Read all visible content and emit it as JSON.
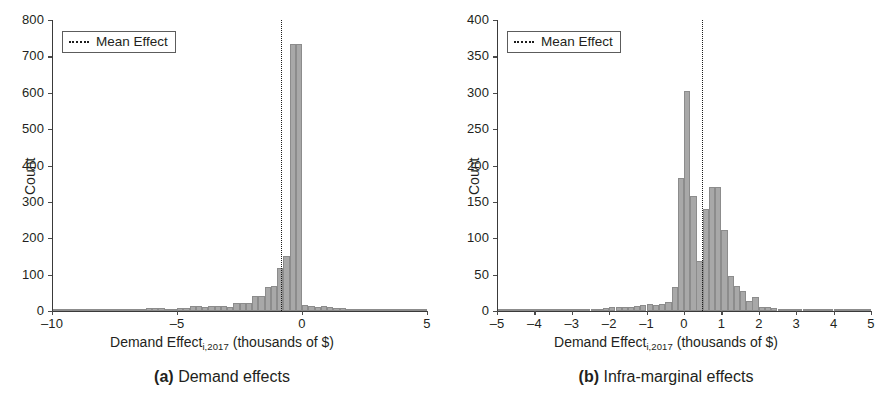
{
  "figure": {
    "panels": [
      {
        "id": "a",
        "caption_tag": "(a)",
        "caption_text": "Demand effects",
        "legend": {
          "label": "Mean Effect",
          "style": "dotted",
          "color": "#1d1d1d"
        },
        "chart_data": {
          "type": "bar",
          "subtype": "histogram",
          "title": "",
          "xlabel": "Demand Effect_{i,2017} (thousands of $)",
          "xlabel_main": "Demand Effect",
          "xlabel_sub": "i,2017",
          "xlabel_tail": " (thousands of $)",
          "ylabel": "Count",
          "xlim": [
            -10,
            5
          ],
          "ylim": [
            0,
            800
          ],
          "grid": false,
          "legend_position": "upper-left",
          "xticks": [
            -10,
            -5,
            0,
            5
          ],
          "xtick_labels": [
            "–10",
            "–5",
            "0",
            "5"
          ],
          "yticks": [
            0,
            100,
            200,
            300,
            400,
            500,
            600,
            700,
            800
          ],
          "ytick_labels": [
            "0",
            "100",
            "200",
            "300",
            "400",
            "500",
            "600",
            "700",
            "800"
          ],
          "bin_width": 0.25,
          "bar_color": "#a8a8a8",
          "annotations": [
            {
              "name": "mean-effect-line",
              "type": "vline",
              "x": -0.85,
              "label": "Mean Effect"
            }
          ],
          "bins": [
            {
              "x0": -10.0,
              "value": 2
            },
            {
              "x0": -9.75,
              "value": 2
            },
            {
              "x0": -9.5,
              "value": 2
            },
            {
              "x0": -9.25,
              "value": 3
            },
            {
              "x0": -9.0,
              "value": 3
            },
            {
              "x0": -8.75,
              "value": 3
            },
            {
              "x0": -8.5,
              "value": 3
            },
            {
              "x0": -8.25,
              "value": 4
            },
            {
              "x0": -8.0,
              "value": 4
            },
            {
              "x0": -7.75,
              "value": 4
            },
            {
              "x0": -7.5,
              "value": 4
            },
            {
              "x0": -7.25,
              "value": 5
            },
            {
              "x0": -7.0,
              "value": 5
            },
            {
              "x0": -6.75,
              "value": 5
            },
            {
              "x0": -6.5,
              "value": 6
            },
            {
              "x0": -6.25,
              "value": 9
            },
            {
              "x0": -6.0,
              "value": 9
            },
            {
              "x0": -5.75,
              "value": 7
            },
            {
              "x0": -5.5,
              "value": 6
            },
            {
              "x0": -5.25,
              "value": 6
            },
            {
              "x0": -5.0,
              "value": 7
            },
            {
              "x0": -4.75,
              "value": 8
            },
            {
              "x0": -4.5,
              "value": 13
            },
            {
              "x0": -4.25,
              "value": 13
            },
            {
              "x0": -4.0,
              "value": 12
            },
            {
              "x0": -3.75,
              "value": 13
            },
            {
              "x0": -3.5,
              "value": 13
            },
            {
              "x0": -3.25,
              "value": 13
            },
            {
              "x0": -3.0,
              "value": 11
            },
            {
              "x0": -2.75,
              "value": 22
            },
            {
              "x0": -2.5,
              "value": 22
            },
            {
              "x0": -2.25,
              "value": 23
            },
            {
              "x0": -2.0,
              "value": 42
            },
            {
              "x0": -1.75,
              "value": 42
            },
            {
              "x0": -1.5,
              "value": 67
            },
            {
              "x0": -1.25,
              "value": 68
            },
            {
              "x0": -1.0,
              "value": 117
            },
            {
              "x0": -0.75,
              "value": 150
            },
            {
              "x0": -0.5,
              "value": 735
            },
            {
              "x0": -0.25,
              "value": 735
            },
            {
              "x0": 0.0,
              "value": 16
            },
            {
              "x0": 0.25,
              "value": 14
            },
            {
              "x0": 0.5,
              "value": 12
            },
            {
              "x0": 0.75,
              "value": 14
            },
            {
              "x0": 1.0,
              "value": 11
            },
            {
              "x0": 1.25,
              "value": 9
            },
            {
              "x0": 1.5,
              "value": 7
            },
            {
              "x0": 1.75,
              "value": 6
            },
            {
              "x0": 2.0,
              "value": 5
            },
            {
              "x0": 2.25,
              "value": 4
            },
            {
              "x0": 2.5,
              "value": 4
            },
            {
              "x0": 2.75,
              "value": 3
            },
            {
              "x0": 3.0,
              "value": 3
            },
            {
              "x0": 3.25,
              "value": 3
            },
            {
              "x0": 3.5,
              "value": 3
            },
            {
              "x0": 3.75,
              "value": 3
            },
            {
              "x0": 4.0,
              "value": 2
            },
            {
              "x0": 4.25,
              "value": 2
            },
            {
              "x0": 4.5,
              "value": 2
            },
            {
              "x0": 4.75,
              "value": 2
            }
          ]
        }
      },
      {
        "id": "b",
        "caption_tag": "(b)",
        "caption_text": "Infra-marginal effects",
        "legend": {
          "label": "Mean Effect",
          "style": "dotted",
          "color": "#1d1d1d"
        },
        "chart_data": {
          "type": "bar",
          "subtype": "histogram",
          "title": "",
          "xlabel": "Demand Effect_{i,2017} (thousands of $)",
          "xlabel_main": "Demand Effect",
          "xlabel_sub": "i,2017",
          "xlabel_tail": " (thousands of $)",
          "ylabel": "Count",
          "xlim": [
            -5,
            5
          ],
          "ylim": [
            0,
            400
          ],
          "grid": false,
          "legend_position": "upper-left",
          "xticks": [
            -5,
            -4,
            -3,
            -2,
            -1,
            0,
            1,
            2,
            3,
            4,
            5
          ],
          "xtick_labels": [
            "–5",
            "–4",
            "–3",
            "–2",
            "–1",
            "0",
            "1",
            "2",
            "3",
            "4",
            "5"
          ],
          "yticks": [
            0,
            50,
            100,
            150,
            200,
            250,
            300,
            350,
            400
          ],
          "ytick_labels": [
            "0",
            "50",
            "100",
            "150",
            "200",
            "250",
            "300",
            "350",
            "400"
          ],
          "bin_width": 0.1667,
          "bar_color": "#a8a8a8",
          "annotations": [
            {
              "name": "mean-effect-line",
              "type": "vline",
              "x": 0.47,
              "label": "Mean Effect"
            }
          ],
          "bins": [
            {
              "x0": -5.0,
              "value": 1
            },
            {
              "x0": -4.83,
              "value": 1
            },
            {
              "x0": -4.67,
              "value": 1
            },
            {
              "x0": -4.5,
              "value": 1
            },
            {
              "x0": -4.33,
              "value": 1
            },
            {
              "x0": -4.17,
              "value": 2
            },
            {
              "x0": -4.0,
              "value": 2
            },
            {
              "x0": -3.83,
              "value": 1
            },
            {
              "x0": -3.67,
              "value": 1
            },
            {
              "x0": -3.5,
              "value": 1
            },
            {
              "x0": -3.33,
              "value": 2
            },
            {
              "x0": -3.17,
              "value": 2
            },
            {
              "x0": -3.0,
              "value": 2
            },
            {
              "x0": -2.83,
              "value": 2
            },
            {
              "x0": -2.67,
              "value": 2
            },
            {
              "x0": -2.5,
              "value": 2
            },
            {
              "x0": -2.33,
              "value": 3
            },
            {
              "x0": -2.17,
              "value": 4
            },
            {
              "x0": -2.0,
              "value": 5
            },
            {
              "x0": -1.83,
              "value": 5
            },
            {
              "x0": -1.67,
              "value": 5
            },
            {
              "x0": -1.5,
              "value": 6
            },
            {
              "x0": -1.33,
              "value": 7
            },
            {
              "x0": -1.17,
              "value": 8
            },
            {
              "x0": -1.0,
              "value": 9
            },
            {
              "x0": -0.83,
              "value": 8
            },
            {
              "x0": -0.67,
              "value": 9
            },
            {
              "x0": -0.5,
              "value": 13
            },
            {
              "x0": -0.33,
              "value": 33
            },
            {
              "x0": -0.17,
              "value": 183
            },
            {
              "x0": 0.0,
              "value": 303
            },
            {
              "x0": 0.17,
              "value": 158
            },
            {
              "x0": 0.33,
              "value": 69
            },
            {
              "x0": 0.5,
              "value": 140
            },
            {
              "x0": 0.67,
              "value": 170
            },
            {
              "x0": 0.83,
              "value": 170
            },
            {
              "x0": 1.0,
              "value": 111
            },
            {
              "x0": 1.17,
              "value": 48
            },
            {
              "x0": 1.33,
              "value": 35
            },
            {
              "x0": 1.5,
              "value": 27
            },
            {
              "x0": 1.67,
              "value": 14
            },
            {
              "x0": 1.83,
              "value": 19
            },
            {
              "x0": 2.0,
              "value": 6
            },
            {
              "x0": 2.17,
              "value": 5
            },
            {
              "x0": 2.33,
              "value": 4
            },
            {
              "x0": 2.5,
              "value": 3
            },
            {
              "x0": 2.67,
              "value": 2
            },
            {
              "x0": 2.83,
              "value": 2
            },
            {
              "x0": 3.0,
              "value": 1
            },
            {
              "x0": 3.17,
              "value": 1
            },
            {
              "x0": 3.33,
              "value": 1
            },
            {
              "x0": 3.5,
              "value": 1
            },
            {
              "x0": 3.67,
              "value": 1
            },
            {
              "x0": 3.83,
              "value": 2
            },
            {
              "x0": 4.0,
              "value": 1
            },
            {
              "x0": 4.17,
              "value": 1
            },
            {
              "x0": 4.33,
              "value": 1
            },
            {
              "x0": 4.5,
              "value": 1
            },
            {
              "x0": 4.67,
              "value": 2
            },
            {
              "x0": 4.83,
              "value": 1
            }
          ]
        }
      }
    ]
  }
}
